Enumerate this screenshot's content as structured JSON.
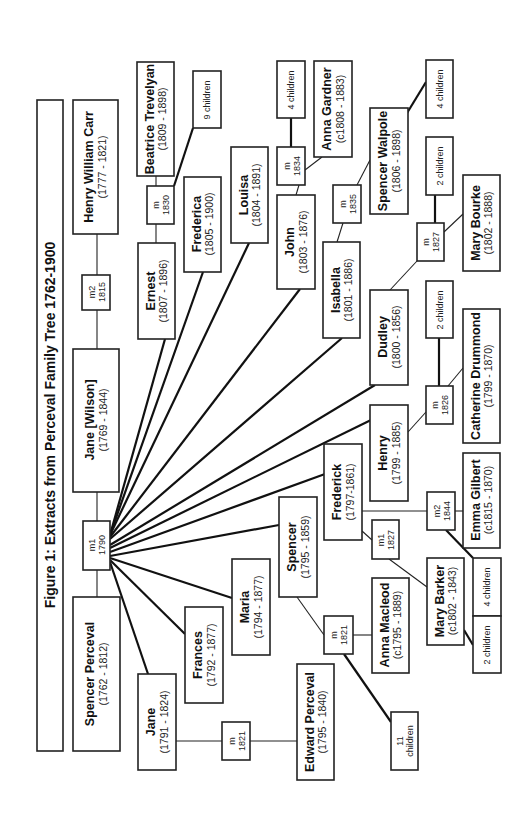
{
  "title": "Figure 1:  Extracts from Perceval Family Tree 1762-1900",
  "people": {
    "spencer_perceval": {
      "name": "Spencer Perceval",
      "dates": "(1762 - 1812)"
    },
    "jane_wilson": {
      "name": "Jane [Wilson]",
      "dates": "(1769 - 1844)"
    },
    "henry_william_carr": {
      "name": "Henry William Carr",
      "dates": "(1777 - 1821)"
    },
    "beatrice_trevelyan": {
      "name": "Beatrice Trevelyan",
      "dates": "(1809 - 1898)"
    },
    "ernest": {
      "name": "Ernest",
      "dates": "(1807 - 1896)"
    },
    "frederica": {
      "name": "Frederica",
      "dates": "(1805 - 1900)"
    },
    "louisa": {
      "name": "Louisa",
      "dates": "(1804 - 1891)"
    },
    "anna_gardner": {
      "name": "Anna Gardner",
      "dates": "(c1808 - 1883)"
    },
    "john": {
      "name": "John",
      "dates": "(1803 - 1876)"
    },
    "isabella": {
      "name": "Isabella",
      "dates": "(1801 - 1886)"
    },
    "spencer_walpole": {
      "name": "Spencer Walpole",
      "dates": "(1806 - 1898)"
    },
    "mary_bourke": {
      "name": "Mary Bourke",
      "dates": "(1802 - 1888)"
    },
    "dudley": {
      "name": "Dudley",
      "dates": "(1800 - 1856)"
    },
    "catherine_drummond": {
      "name": "Catherine Drummond",
      "dates": "(1799 - 1870)"
    },
    "henry": {
      "name": "Henry",
      "dates": "(1799 - 1885)"
    },
    "frederick": {
      "name": "Frederick",
      "dates": "(1797-1861)"
    },
    "emma_gilbert": {
      "name": "Emma Gilbert",
      "dates": "(c1815 - 1870)"
    },
    "mary_barker": {
      "name": "Mary Barker",
      "dates": "(c1802 - 1843)"
    },
    "spencer": {
      "name": "Spencer",
      "dates": "(1795 - 1859)"
    },
    "anna_macleod": {
      "name": "Anna Macleod",
      "dates": "(c1795 - 1889)"
    },
    "maria": {
      "name": "Maria",
      "dates": "(1794 - 1877)"
    },
    "frances": {
      "name": "Frances",
      "dates": "(1792 - 1877)"
    },
    "jane": {
      "name": "Jane",
      "dates": "(1791 - 1824)"
    },
    "edward_perceval": {
      "name": "Edward Perceval",
      "dates": "(1795 - 1840)"
    }
  },
  "marriages": {
    "m1_1790": {
      "label": "m1",
      "year": "1790"
    },
    "m2_1815": {
      "label": "m2",
      "year": "1815"
    },
    "m_1830": {
      "label": "m",
      "year": "1830"
    },
    "m_1834": {
      "label": "m",
      "year": "1834"
    },
    "m_1835": {
      "label": "m",
      "year": "1835"
    },
    "m_1827_dudley": {
      "label": "m",
      "year": "1827"
    },
    "m_1826": {
      "label": "m",
      "year": "1826"
    },
    "m2_1844": {
      "label": "m2",
      "year": "1844"
    },
    "m1_1827": {
      "label": "m1",
      "year": "1827"
    },
    "m_1821_spencer": {
      "label": "m",
      "year": "1821"
    },
    "m_1821_jane": {
      "label": "m",
      "year": "1821"
    }
  },
  "children": {
    "ernest_beatrice": "9 children",
    "john_anna": "4 children",
    "isabella_walpole": "4 children",
    "dudley_bourke": "2 children",
    "henry_drummond": "2 children",
    "frederick_gilbert": "4 children",
    "frederick_barker": "2 children",
    "spencer_macleod_a": "11",
    "spencer_macleod_b": "children"
  }
}
